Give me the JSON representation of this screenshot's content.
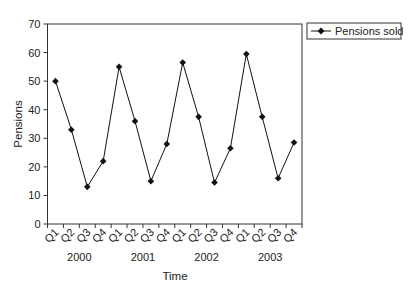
{
  "chart_data": {
    "type": "line",
    "title": "",
    "xlabel": "Time",
    "ylabel": "Pensions",
    "ylim": [
      0,
      70
    ],
    "yticks": [
      0,
      10,
      20,
      30,
      40,
      50,
      60,
      70
    ],
    "grid": false,
    "legend_position": "right-top",
    "categories": [
      "Q1",
      "Q2",
      "Q3",
      "Q4",
      "Q1",
      "Q2",
      "Q3",
      "Q4",
      "Q1",
      "Q2",
      "Q3",
      "Q4",
      "Q1",
      "Q2",
      "Q3",
      "Q4"
    ],
    "category_groups": [
      {
        "label": "2000",
        "start": 0,
        "end": 3
      },
      {
        "label": "2001",
        "start": 4,
        "end": 7
      },
      {
        "label": "2002",
        "start": 8,
        "end": 11
      },
      {
        "label": "2003",
        "start": 12,
        "end": 15
      }
    ],
    "series": [
      {
        "name": "Pensions sold",
        "marker": "diamond",
        "color": "#111111",
        "values": [
          50,
          33,
          13,
          22,
          55,
          36,
          15,
          28,
          56.5,
          37.5,
          14.5,
          26.5,
          59.5,
          37.5,
          16,
          28.5
        ]
      }
    ]
  },
  "legend": {
    "items": [
      {
        "label": "Pensions sold"
      }
    ]
  },
  "axes": {
    "x_title": "Time",
    "y_title": "Pensions"
  }
}
